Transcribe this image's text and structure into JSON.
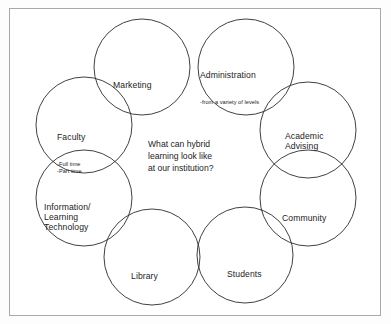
{
  "diagram": {
    "type": "venn-ring",
    "title": "What can hybrid learning look like at our institution?",
    "center": {
      "text": "What can hybrid\nlearning look like\nat our institution?",
      "lines": [
        "What can hybrid",
        "learning look like",
        "at our institution?"
      ]
    },
    "colors": {
      "circle_stroke": "#2b2b2b",
      "text": "#1c1c1c",
      "frame_border": "#a8a8a8",
      "background": "#ffffff",
      "canvas": "#fdfdfd"
    },
    "geometry": {
      "radius": 48,
      "ring_center_x": 196,
      "ring_center_y": 162
    },
    "nodes": [
      {
        "id": "marketing",
        "label": "Marketing",
        "sub": "",
        "cx": 142,
        "cy": 67,
        "r": 48,
        "position": "top-left"
      },
      {
        "id": "administration",
        "label": "Administration",
        "sub": "-from a variety of levels",
        "cx": 246,
        "cy": 67,
        "r": 48,
        "position": "top-right"
      },
      {
        "id": "faculty",
        "label": "Faculty",
        "sub": "-Full time\n-Part time",
        "cx": 84,
        "cy": 125,
        "r": 48,
        "position": "left-upper"
      },
      {
        "id": "academic-advising",
        "label": "Academic\nAdvising",
        "sub": "",
        "cx": 308,
        "cy": 130,
        "r": 48,
        "position": "right-upper"
      },
      {
        "id": "information-learning-technology",
        "label": "Information/\nLearning\nTechnology",
        "sub": "",
        "cx": 84,
        "cy": 198,
        "r": 48,
        "position": "left-lower"
      },
      {
        "id": "community",
        "label": "Community",
        "sub": "",
        "cx": 308,
        "cy": 198,
        "r": 48,
        "position": "right-lower"
      },
      {
        "id": "library",
        "label": "Library",
        "sub": "",
        "cx": 152,
        "cy": 257,
        "r": 48,
        "position": "bottom-left"
      },
      {
        "id": "students",
        "label": "Students",
        "sub": "",
        "cx": 245,
        "cy": 255,
        "r": 48,
        "position": "bottom-right"
      }
    ]
  }
}
